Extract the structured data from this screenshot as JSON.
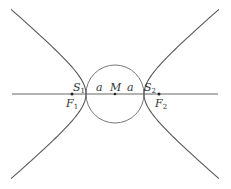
{
  "diagram": {
    "labels": {
      "S1": "S",
      "S1_sub": "1",
      "S2": "S",
      "S2_sub": "2",
      "F1": "F",
      "F1_sub": "1",
      "F2": "F",
      "F2_sub": "2",
      "M": "M",
      "a_left": "a",
      "a_right": "a"
    },
    "colors": {
      "stroke": "#666666",
      "text": "#333333"
    }
  }
}
